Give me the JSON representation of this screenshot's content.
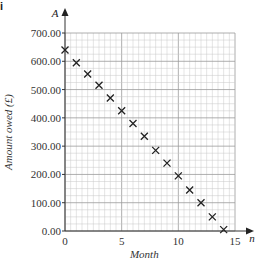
{
  "part_label": "i",
  "chart_data": {
    "type": "scatter",
    "title": "",
    "xlabel": "Month",
    "ylabel": "Amount owed (£)",
    "x_axis_symbol": "n",
    "y_axis_symbol": "A",
    "xlim": [
      0,
      15
    ],
    "ylim": [
      0,
      700
    ],
    "xticks": [
      0,
      5,
      10,
      15
    ],
    "xtick_labels": [
      "0",
      "5",
      "10",
      "15"
    ],
    "yticks": [
      0,
      100,
      200,
      300,
      400,
      500,
      600,
      700
    ],
    "ytick_labels": [
      "0.00",
      "100.00",
      "200.00",
      "300.00",
      "400.00",
      "500.00",
      "600.00",
      "700.00"
    ],
    "grid": true,
    "marker": "x",
    "x": [
      0,
      1,
      2,
      3,
      4,
      5,
      6,
      7,
      8,
      9,
      10,
      11,
      12,
      13,
      14
    ],
    "y": [
      640,
      595,
      555,
      515,
      470,
      425,
      380,
      335,
      285,
      240,
      195,
      145,
      100,
      50,
      5
    ]
  }
}
